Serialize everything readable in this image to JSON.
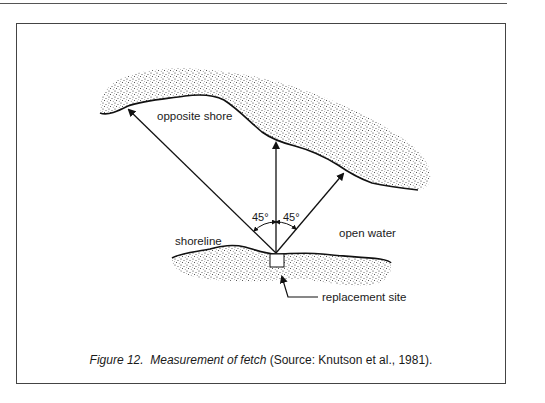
{
  "figure": {
    "labels": {
      "opposite_shore": "opposite shore",
      "open_water": "open water",
      "shoreline": "shoreline",
      "replacement_site": "replacement site",
      "angle_left": "45°",
      "angle_right": "45°"
    },
    "caption": {
      "figure_number": "Figure 12.",
      "title": "Measurement of fetch",
      "source": "(Source:  Knutson et al., 1981)."
    }
  }
}
